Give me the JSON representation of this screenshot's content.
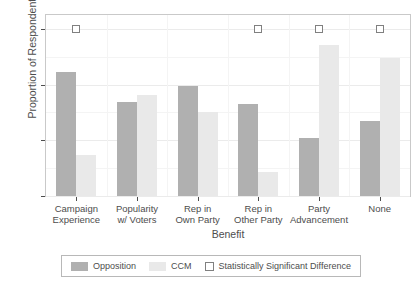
{
  "chart_data": {
    "type": "bar",
    "title": "",
    "subtitle": "",
    "xlabel": "Benefit",
    "ylabel": "Proportion of Respondents",
    "ylim": [
      0,
      0.65
    ],
    "y_ticks": [
      0.0,
      0.2,
      0.4,
      0.6
    ],
    "y_tick_labels": [
      "0.0",
      "0.2",
      "0.4",
      "0.6"
    ],
    "grid": true,
    "legend_position": "bottom",
    "categories": [
      "Campaign Experience",
      "Popularity w/ Voters",
      "Rep in Own Party",
      "Rep in Other Party",
      "Party Advancement",
      "None"
    ],
    "category_lines": [
      [
        "Campaign",
        "Experience"
      ],
      [
        "Popularity",
        "w/ Voters"
      ],
      [
        "Rep in",
        "Own Party"
      ],
      [
        "Rep in",
        "Other Party"
      ],
      [
        "Party",
        "Advancement"
      ],
      [
        "None",
        ""
      ]
    ],
    "series": [
      {
        "name": "Opposition",
        "color": "#b0b0b0",
        "values": [
          0.445,
          0.337,
          0.396,
          0.33,
          0.207,
          0.27
        ]
      },
      {
        "name": "CCM",
        "color": "#e9e9e9",
        "values": [
          0.147,
          0.361,
          0.3,
          0.088,
          0.544,
          0.495
        ]
      }
    ],
    "annotations": {
      "name": "Statistically Significant Difference",
      "marker": "open-square",
      "marker_color": "#ffffff",
      "marker_border": "#808080",
      "y_value": 0.6,
      "present_for": [
        true,
        false,
        false,
        true,
        true,
        true
      ]
    }
  },
  "legend": {
    "entries": [
      {
        "label": "Opposition",
        "swatch": "opposition-swatch"
      },
      {
        "label": "CCM",
        "swatch": "ccm-swatch"
      },
      {
        "label": "Statistically Significant Difference",
        "swatch": "significance-square-swatch"
      }
    ]
  }
}
